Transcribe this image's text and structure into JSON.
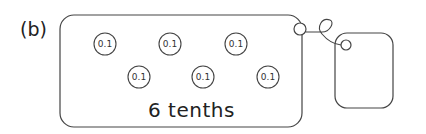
{
  "label": "(b)",
  "caption": "6 tenths",
  "coin_value": "0.1",
  "coins": [
    {
      "x": 105,
      "y": 44,
      "label": "0.1"
    },
    {
      "x": 170,
      "y": 44,
      "label": "0.1"
    },
    {
      "x": 236,
      "y": 44,
      "label": "0.1"
    },
    {
      "x": 139,
      "y": 77,
      "label": "0.1"
    },
    {
      "x": 203,
      "y": 77,
      "label": "0.1"
    },
    {
      "x": 268,
      "y": 77,
      "label": "0.1"
    }
  ],
  "colors": {
    "stroke": "#333333",
    "text": "#222222"
  }
}
